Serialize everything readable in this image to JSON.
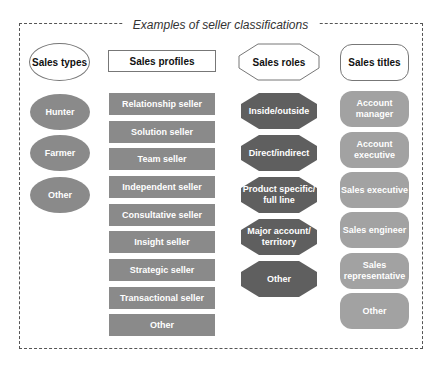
{
  "title": "Examples of seller classifications",
  "colors": {
    "oval_fill": "#8a8a8a",
    "rect_fill": "#8a8a8a",
    "octagon_fill": "#5f5f5f",
    "rounded_fill": "#a2a2a2",
    "border": "#777777"
  },
  "columns": [
    {
      "header": "Sales types",
      "shape": "oval",
      "items": [
        "Hunter",
        "Farmer",
        "Other"
      ]
    },
    {
      "header": "Sales profiles",
      "shape": "rectangle",
      "items": [
        "Relationship seller",
        "Solution seller",
        "Team seller",
        "Independent seller",
        "Consultative seller",
        "Insight seller",
        "Strategic seller",
        "Transactional seller",
        "Other"
      ]
    },
    {
      "header": "Sales roles",
      "shape": "octagon",
      "items": [
        "Inside/outside",
        "Direct/indirect",
        "Product specific/ full line",
        "Major account/ territory",
        "Other"
      ]
    },
    {
      "header": "Sales titles",
      "shape": "rounded-rectangle",
      "items": [
        "Account manager",
        "Account executive",
        "Sales executive",
        "Sales engineer",
        "Sales representative",
        "Other"
      ]
    }
  ]
}
